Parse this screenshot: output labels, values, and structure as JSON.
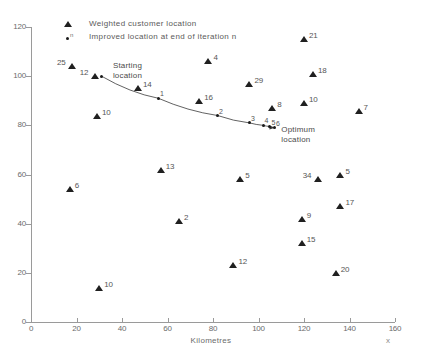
{
  "chart_data": {
    "type": "scatter",
    "title": "",
    "xlabel": "Kilometres",
    "xvar": "x",
    "ylabel": "Kilometres",
    "xlim": [
      0,
      160
    ],
    "ylim": [
      0,
      120
    ],
    "xticks": [
      0,
      20,
      40,
      60,
      80,
      100,
      120,
      140,
      160
    ],
    "yticks": [
      0,
      20,
      40,
      60,
      80,
      100,
      120
    ],
    "grid": false,
    "legend": {
      "position": "top-center",
      "entries": [
        {
          "marker": "triangle",
          "label": "Weighted customer location"
        },
        {
          "marker": "dot-n",
          "label": "Improved location at end of iteration n",
          "superscript": "n"
        }
      ]
    },
    "series": [
      {
        "name": "Weighted customer location",
        "marker": "triangle",
        "points": [
          {
            "x": 18,
            "y": 104,
            "weight": "25",
            "label_side": "left"
          },
          {
            "x": 28,
            "y": 100,
            "weight": "12",
            "label_side": "left"
          },
          {
            "x": 29,
            "y": 84,
            "weight": "10",
            "label_side": "right"
          },
          {
            "x": 47,
            "y": 95,
            "weight": "14",
            "label_side": "right"
          },
          {
            "x": 78,
            "y": 106,
            "weight": "4",
            "label_side": "right"
          },
          {
            "x": 74,
            "y": 90,
            "weight": "16",
            "label_side": "right"
          },
          {
            "x": 96,
            "y": 97,
            "weight": "29",
            "label_side": "right"
          },
          {
            "x": 106,
            "y": 87,
            "weight": "8",
            "label_side": "right"
          },
          {
            "x": 120,
            "y": 115,
            "weight": "21",
            "label_side": "right"
          },
          {
            "x": 124,
            "y": 101,
            "weight": "18",
            "label_side": "right"
          },
          {
            "x": 120,
            "y": 89,
            "weight": "10",
            "label_side": "right"
          },
          {
            "x": 144,
            "y": 86,
            "weight": "7",
            "label_side": "right"
          },
          {
            "x": 57,
            "y": 62,
            "weight": "13",
            "label_side": "right"
          },
          {
            "x": 17,
            "y": 54,
            "weight": "6",
            "label_side": "right"
          },
          {
            "x": 65,
            "y": 41,
            "weight": "2",
            "label_side": "right"
          },
          {
            "x": 92,
            "y": 58,
            "weight": "5",
            "label_side": "right"
          },
          {
            "x": 126,
            "y": 58,
            "weight": "34",
            "label_side": "left"
          },
          {
            "x": 136,
            "y": 60,
            "weight": "5",
            "label_side": "right"
          },
          {
            "x": 136,
            "y": 47,
            "weight": "17",
            "label_side": "right"
          },
          {
            "x": 119,
            "y": 42,
            "weight": "9",
            "label_side": "right"
          },
          {
            "x": 119,
            "y": 32,
            "weight": "15",
            "label_side": "right"
          },
          {
            "x": 89,
            "y": 23,
            "weight": "12",
            "label_side": "right"
          },
          {
            "x": 134,
            "y": 20,
            "weight": "20",
            "label_side": "right"
          },
          {
            "x": 30,
            "y": 14,
            "weight": "10",
            "label_side": "right"
          }
        ]
      },
      {
        "name": "Improved location at end of iteration n",
        "marker": "dot",
        "points": [
          {
            "x": 31,
            "y": 100,
            "iteration": "",
            "label": ""
          },
          {
            "x": 56,
            "y": 91,
            "iteration": "1",
            "label": "1"
          },
          {
            "x": 82,
            "y": 84,
            "iteration": "2",
            "label": "2"
          },
          {
            "x": 96,
            "y": 81,
            "iteration": "3",
            "label": "3"
          },
          {
            "x": 102,
            "y": 80,
            "iteration": "4",
            "label": "4"
          },
          {
            "x": 105,
            "y": 79.5,
            "iteration": "5",
            "label": "5"
          },
          {
            "x": 107,
            "y": 79,
            "iteration": "6",
            "label": "6"
          }
        ]
      }
    ],
    "annotations": [
      {
        "name": "starting-location",
        "text_line1": "Starting",
        "text_line2": "location",
        "x": 36,
        "y": 104
      },
      {
        "name": "optimum-location",
        "text_line1": "Optimum",
        "text_line2": "location",
        "x": 110,
        "y": 78
      }
    ]
  }
}
